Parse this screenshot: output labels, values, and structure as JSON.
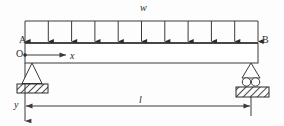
{
  "figure": {
    "colors": {
      "stroke": "#3a3a3a",
      "beam_fill": "#ffffff",
      "hatch": "#2b2b2b",
      "background": "#fdfdfd"
    },
    "labels": {
      "distributed_load": "w",
      "left_end": "A",
      "right_end": "B",
      "origin": "O",
      "x_axis": "x",
      "y_axis": "y",
      "span": "l"
    },
    "load": {
      "type": "uniformly-distributed",
      "symbol": "w",
      "arrow_count": 11,
      "direction": "downward",
      "load_line_y": 21,
      "beam_top_y": 43,
      "start_x": 25,
      "end_x": 258
    },
    "beam": {
      "left_x": 25,
      "right_x": 258,
      "top_y": 43,
      "bottom_y": 63,
      "depth": 20
    },
    "supports": {
      "left": {
        "kind": "pin-support",
        "label": "A",
        "x": 32,
        "apex_y": 63,
        "base_y": 84
      },
      "right": {
        "kind": "roller-support",
        "label": "B",
        "x": 251,
        "apex_y": 63,
        "base_y": 84
      }
    },
    "dimension": {
      "symbol": "l",
      "from_x": 25,
      "to_x": 251,
      "y": 106,
      "describes": "span-length"
    },
    "axes": {
      "origin_x": 25,
      "origin_y": 55,
      "x_axis": {
        "label": "x",
        "direction": "right",
        "end_x": 66
      },
      "y_axis": {
        "label": "y",
        "direction": "down",
        "end_y": 122
      }
    }
  }
}
